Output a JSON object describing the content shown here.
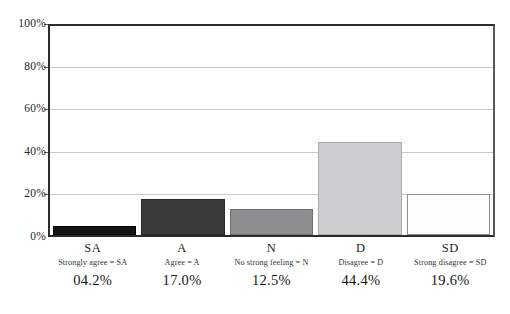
{
  "chart_data": {
    "type": "bar",
    "title": "",
    "subtitle": "",
    "xlabel": "",
    "ylabel": "",
    "categories": [
      "SA",
      "A",
      "N",
      "D",
      "SD"
    ],
    "values": [
      4.2,
      17.0,
      12.5,
      44.4,
      19.6
    ],
    "value_labels": [
      "04.2%",
      "17.0%",
      "12.5%",
      "44.4%",
      "19.6%"
    ],
    "category_legends": [
      "Strongly agree = SA",
      "Agree = A",
      "No strong feeling = N",
      "Disagree = D",
      "Strong disagree = SD"
    ],
    "bar_colors": [
      "#141414",
      "#3b3b3b",
      "#8e8e90",
      "#cfcfd1",
      "#fdfdfd"
    ],
    "bar_border_colors": [
      "#000000",
      "#2a2a2a",
      "#6e6e70",
      "#a9a9ab",
      "#8f8f91"
    ],
    "ylim": [
      0,
      100
    ],
    "y_ticks": [
      0,
      20,
      40,
      60,
      80,
      100
    ],
    "y_tick_labels": [
      "0%",
      "20%",
      "40%",
      "60%",
      "80%",
      "100%"
    ],
    "grid": true,
    "grid_color": "#c9c9cb",
    "legend": "none",
    "axis_color": "#2b2b2b"
  }
}
